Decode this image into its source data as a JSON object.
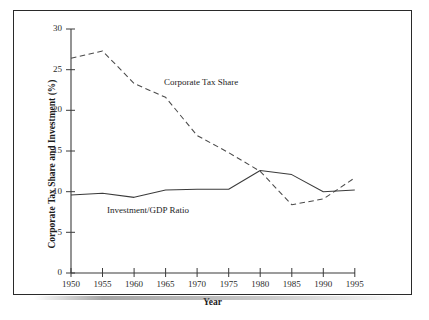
{
  "chart_data": {
    "type": "line",
    "title": "",
    "xlabel": "Year",
    "ylabel": "Corporate Tax Share and Investment (%)",
    "x": [
      1950,
      1955,
      1960,
      1965,
      1970,
      1975,
      1980,
      1985,
      1990,
      1995
    ],
    "xlim": [
      1950,
      1995
    ],
    "ylim": [
      0,
      30
    ],
    "xticks": [
      "1950",
      "1955",
      "1960",
      "1965",
      "1970",
      "1975",
      "1980",
      "1985",
      "1990",
      "1995"
    ],
    "yticks": [
      "0",
      "5",
      "10",
      "15",
      "20",
      "25",
      "30"
    ],
    "grid": false,
    "legend_position": "inline-annotations",
    "series": [
      {
        "name": "Corporate Tax Share",
        "style": "dashed",
        "color": "#4a4a4a",
        "values": [
          26.4,
          27.3,
          23.3,
          21.6,
          16.9,
          14.8,
          12.5,
          8.4,
          9.1,
          11.7
        ]
      },
      {
        "name": "Investment/GDP Ratio",
        "style": "solid",
        "color": "#3b3b3b",
        "values": [
          9.6,
          9.8,
          9.3,
          10.2,
          10.3,
          10.3,
          12.6,
          12.1,
          10.0,
          10.2
        ]
      }
    ],
    "annotations": [
      {
        "text": "Corporate Tax Share",
        "x": 1967,
        "y": 24.0
      },
      {
        "text": "Investment/GDP Ratio",
        "x": 1958,
        "y": 7.6
      }
    ]
  },
  "axes": {
    "x_title": "Year",
    "y_title": "Corporate Tax Share and Investment (%)"
  }
}
